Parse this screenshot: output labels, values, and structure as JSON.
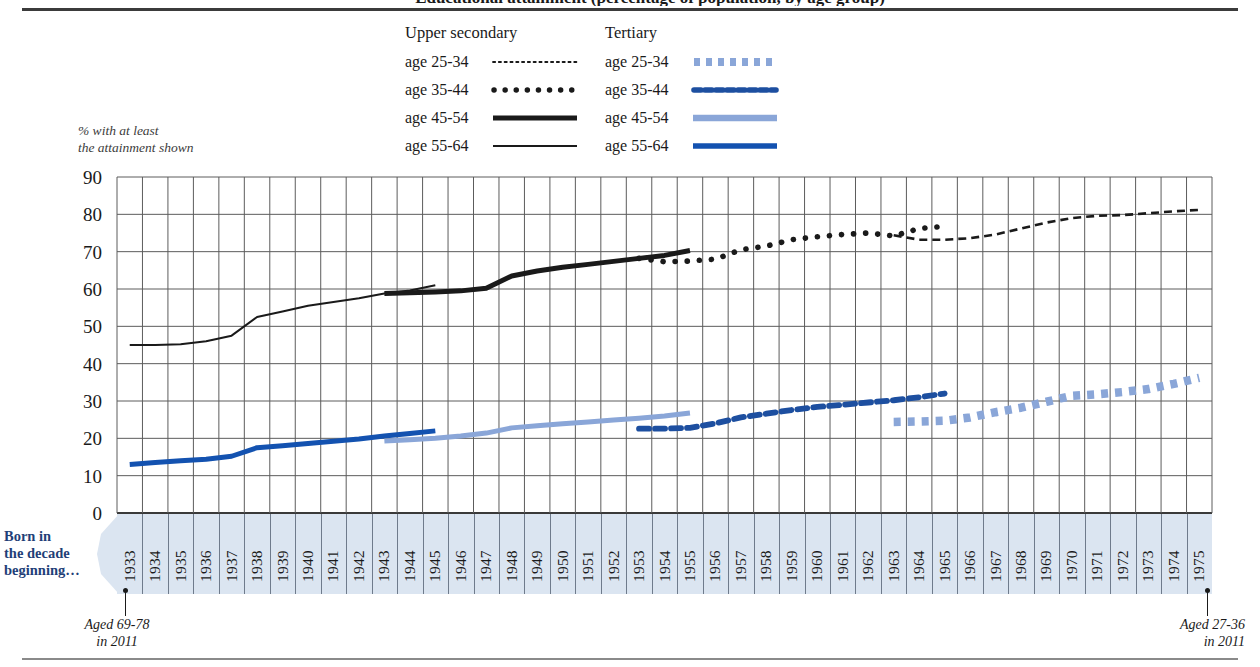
{
  "header": {
    "title_clipped": "Educational attainment (percentage of population, by age group)"
  },
  "legend": {
    "groups": [
      {
        "name": "upper-secondary",
        "heading": "Upper secondary",
        "items": [
          {
            "label": "age 25-34",
            "style": "fine-dotted",
            "color": "#1a1a1a"
          },
          {
            "label": "age 35-44",
            "style": "round-dotted",
            "color": "#1a1a1a"
          },
          {
            "label": "age 45-54",
            "style": "thick-solid",
            "color": "#1a1a1a"
          },
          {
            "label": "age 55-64",
            "style": "thin-solid",
            "color": "#1a1a1a"
          }
        ]
      },
      {
        "name": "tertiary",
        "heading": "Tertiary",
        "items": [
          {
            "label": "age 25-34",
            "style": "square-dotted",
            "color": "#8aa6d8"
          },
          {
            "label": "age 35-44",
            "style": "dashed",
            "color": "#1d4fa0"
          },
          {
            "label": "age 45-54",
            "style": "thick-solid",
            "color": "#8aa6d8"
          },
          {
            "label": "age 55-64",
            "style": "thick-solid",
            "color": "#1352b0"
          }
        ]
      }
    ]
  },
  "annotations": {
    "y_axis_note_line1": "% with at least",
    "y_axis_note_line2": "the attainment shown",
    "born_in_line1": "Born in",
    "born_in_line2": "the decade",
    "born_in_line3": "beginning…",
    "aged_left_line1": "Aged 69-78",
    "aged_left_line2": "in 2011",
    "aged_right_line1": "Aged 27-36",
    "aged_right_line2": "in 2011"
  },
  "colors": {
    "band": "#dbe5f1",
    "grid": "#5a5a5a",
    "dark_blue": "#1352b0",
    "mid_blue": "#1d4fa0",
    "light_blue": "#8aa6d8",
    "black": "#1a1a1a",
    "caption_blue": "#1f3f78"
  },
  "chart_data": {
    "type": "line",
    "title": "Educational attainment (percentage of population, by age group)",
    "xlabel": "Born in the decade beginning…",
    "ylabel": "% with at least the attainment shown",
    "xlim": [
      1933,
      1975
    ],
    "ylim": [
      0,
      90
    ],
    "yticks": [
      0,
      10,
      20,
      30,
      40,
      50,
      60,
      70,
      80,
      90
    ],
    "grid": true,
    "legend_position": "top-center",
    "categories": [
      1933,
      1934,
      1935,
      1936,
      1937,
      1938,
      1939,
      1940,
      1941,
      1942,
      1943,
      1944,
      1945,
      1946,
      1947,
      1948,
      1949,
      1950,
      1951,
      1952,
      1953,
      1954,
      1955,
      1956,
      1957,
      1958,
      1959,
      1960,
      1961,
      1962,
      1963,
      1964,
      1965,
      1966,
      1967,
      1968,
      1969,
      1970,
      1971,
      1972,
      1973,
      1974,
      1975
    ],
    "series": [
      {
        "name": "Upper secondary, age 55-64",
        "group": "Upper secondary",
        "age": "55-64",
        "color": "#1a1a1a",
        "style": "thin-solid",
        "x": [
          1933,
          1934,
          1935,
          1936,
          1937,
          1938,
          1939,
          1940,
          1941,
          1942,
          1943,
          1944,
          1945
        ],
        "values": [
          45.0,
          45.0,
          45.2,
          46.0,
          47.5,
          52.5,
          54.0,
          55.5,
          56.5,
          57.5,
          58.8,
          59.6,
          61.0
        ]
      },
      {
        "name": "Upper secondary, age 45-54",
        "group": "Upper secondary",
        "age": "45-54",
        "color": "#1a1a1a",
        "style": "thick-solid",
        "x": [
          1943,
          1944,
          1945,
          1946,
          1947,
          1948,
          1949,
          1950,
          1951,
          1952,
          1953,
          1954,
          1955
        ],
        "values": [
          58.8,
          59.0,
          59.2,
          59.5,
          60.2,
          63.5,
          64.8,
          65.8,
          66.6,
          67.4,
          68.2,
          69.0,
          70.3
        ]
      },
      {
        "name": "Upper secondary, age 35-44",
        "group": "Upper secondary",
        "age": "35-44",
        "color": "#1a1a1a",
        "style": "round-dotted",
        "x": [
          1953,
          1954,
          1955,
          1956,
          1957,
          1958,
          1959,
          1960,
          1961,
          1962,
          1963,
          1964,
          1965
        ],
        "values": [
          68.2,
          67.3,
          67.5,
          68.0,
          70.5,
          71.5,
          73.2,
          74.0,
          74.6,
          75.0,
          74.2,
          76.2,
          76.8
        ]
      },
      {
        "name": "Upper secondary, age 25-34",
        "group": "Upper secondary",
        "age": "25-34",
        "color": "#1a1a1a",
        "style": "fine-dashed",
        "x": [
          1963,
          1964,
          1965,
          1966,
          1967,
          1968,
          1969,
          1970,
          1971,
          1972,
          1973,
          1974,
          1975
        ],
        "values": [
          74.4,
          73.2,
          73.2,
          73.6,
          74.6,
          76.2,
          77.8,
          79.0,
          79.6,
          79.8,
          80.3,
          80.8,
          81.2
        ]
      },
      {
        "name": "Tertiary, age 55-64",
        "group": "Tertiary",
        "age": "55-64",
        "color": "#1352b0",
        "style": "thick-solid",
        "x": [
          1933,
          1934,
          1935,
          1936,
          1937,
          1938,
          1939,
          1940,
          1941,
          1942,
          1943,
          1944,
          1945
        ],
        "values": [
          13.0,
          13.5,
          14.0,
          14.4,
          15.2,
          17.5,
          18.0,
          18.6,
          19.2,
          19.8,
          20.6,
          21.3,
          22.0
        ]
      },
      {
        "name": "Tertiary, age 45-54",
        "group": "Tertiary",
        "age": "45-54",
        "color": "#8aa6d8",
        "style": "thick-solid",
        "x": [
          1943,
          1944,
          1945,
          1946,
          1947,
          1948,
          1949,
          1950,
          1951,
          1952,
          1953,
          1954,
          1955
        ],
        "values": [
          19.3,
          19.6,
          20.0,
          20.6,
          21.4,
          22.8,
          23.4,
          23.9,
          24.4,
          24.9,
          25.4,
          26.0,
          26.8
        ]
      },
      {
        "name": "Tertiary, age 35-44",
        "group": "Tertiary",
        "age": "35-44",
        "color": "#1d4fa0",
        "style": "dashed",
        "x": [
          1953,
          1954,
          1955,
          1956,
          1957,
          1958,
          1959,
          1960,
          1961,
          1962,
          1963,
          1964,
          1965
        ],
        "values": [
          22.6,
          22.6,
          22.8,
          24.0,
          25.6,
          26.6,
          27.6,
          28.4,
          29.0,
          29.6,
          30.2,
          31.0,
          32.0
        ]
      },
      {
        "name": "Tertiary, age 25-34",
        "group": "Tertiary",
        "age": "25-34",
        "color": "#8aa6d8",
        "style": "square-dotted",
        "x": [
          1963,
          1964,
          1965,
          1966,
          1967,
          1968,
          1969,
          1970,
          1971,
          1972,
          1973,
          1974,
          1975
        ],
        "values": [
          24.4,
          24.5,
          24.7,
          25.6,
          27.0,
          28.2,
          29.8,
          31.4,
          31.8,
          32.4,
          33.2,
          34.6,
          36.2
        ]
      }
    ]
  }
}
